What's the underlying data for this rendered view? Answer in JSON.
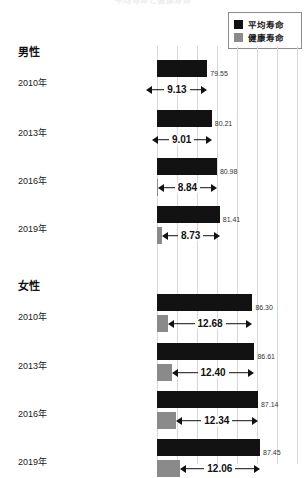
{
  "title": "平均寿命と健康寿命",
  "legend": {
    "items": [
      {
        "label": "平均寿命",
        "color": "#121212",
        "key": "average"
      },
      {
        "label": "健康寿命",
        "color": "#8a8a8a",
        "key": "healthy"
      }
    ]
  },
  "groups": [
    {
      "label": "男性"
    },
    {
      "label": "女性"
    }
  ],
  "chart_data": {
    "type": "bar",
    "orientation": "horizontal",
    "title": "平均寿命と健康寿命",
    "xlabel": "",
    "ylabel": "",
    "xlim": [
      72,
      93.5
    ],
    "grid": true,
    "legend_position": "top-right",
    "series": [
      {
        "name": "平均寿命",
        "color": "#121212"
      },
      {
        "name": "健康寿命",
        "color": "#8a8a8a"
      }
    ],
    "groups": [
      {
        "name": "男性",
        "categories": [
          "2010年",
          "2013年",
          "2016年",
          "2019年"
        ],
        "average": [
          79.55,
          80.21,
          80.98,
          81.41
        ],
        "gap": [
          9.13,
          9.01,
          8.84,
          8.73
        ],
        "healthy": [
          70.42,
          71.2,
          72.14,
          72.68
        ]
      },
      {
        "name": "女性",
        "categories": [
          "2010年",
          "2013年",
          "2016年",
          "2019年"
        ],
        "average": [
          86.3,
          86.61,
          87.14,
          87.45
        ],
        "gap": [
          12.68,
          12.4,
          12.34,
          12.06
        ],
        "healthy": [
          73.62,
          74.21,
          74.8,
          75.38
        ]
      }
    ]
  },
  "rows": [
    {
      "group": "male",
      "year": "2010年",
      "avg_value": "79.55",
      "gap_value": "9.13"
    },
    {
      "group": "male",
      "year": "2013年",
      "avg_value": "80.21",
      "gap_value": "9.01"
    },
    {
      "group": "male",
      "year": "2016年",
      "avg_value": "80.98",
      "gap_value": "8.84"
    },
    {
      "group": "male",
      "year": "2019年",
      "avg_value": "81.41",
      "gap_value": "8.73"
    },
    {
      "group": "female",
      "year": "2010年",
      "avg_value": "86.30",
      "gap_value": "12.68"
    },
    {
      "group": "female",
      "year": "2013年",
      "avg_value": "86.61",
      "gap_value": "12.40"
    },
    {
      "group": "female",
      "year": "2016年",
      "avg_value": "87.14",
      "gap_value": "12.34"
    },
    {
      "group": "female",
      "year": "2019年",
      "avg_value": "87.45",
      "gap_value": "12.06"
    }
  ]
}
